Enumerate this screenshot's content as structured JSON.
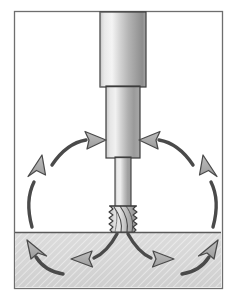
{
  "figure": {
    "title": "Rotary cutting tool in workpiece with chip / coolant flow",
    "caption": "",
    "background_color": "#ffffff",
    "frame": {
      "name": "figure-border",
      "x": 14,
      "y": 11,
      "width": 208,
      "height": 277,
      "stroke_color": "#6e6e6e",
      "stroke_width": 1.4,
      "fill_color": "#ffffff"
    },
    "workpiece": {
      "label": "workpiece",
      "top_y": 232,
      "fill_color": "#d8d8d8",
      "surface_line_color": "#5a5a5a",
      "texture": "fine-diagonal-hatch",
      "texture_color": "#ffffff"
    },
    "tool": {
      "label": "rotary cutting tool",
      "outline_color": "#3b3b3b",
      "metal_light": "#f2f2f2",
      "metal_mid": "#b9b9b9",
      "metal_dark": "#828282",
      "parts": [
        {
          "name": "tool-holder",
          "label": "tool holder",
          "x": 100,
          "y": 11,
          "width": 46,
          "height": 76
        },
        {
          "name": "tool-collar",
          "label": "collar",
          "x": 106,
          "y": 87,
          "width": 34,
          "height": 70
        },
        {
          "name": "tool-shank",
          "label": "shank",
          "x": 115,
          "y": 157,
          "width": 16,
          "height": 48
        },
        {
          "name": "cutter-flutes",
          "label": "fluted cutter",
          "x": 109,
          "y": 205,
          "width": 28,
          "height": 28,
          "flute_count": 4,
          "tooth_count": 9
        }
      ]
    },
    "flow_arrows": {
      "label": "material / coolant flow direction",
      "fill_color": "#a8a8a8",
      "stroke_color": "#4a4a4a",
      "stroke_width": 1.3,
      "items": [
        {
          "name": "arrow-outer-left-up",
          "direction": "up",
          "side": "left",
          "region": "above-surface"
        },
        {
          "name": "arrow-inner-left-in",
          "direction": "right",
          "side": "left",
          "region": "above-surface"
        },
        {
          "name": "arrow-inner-right-in",
          "direction": "left",
          "side": "right",
          "region": "above-surface"
        },
        {
          "name": "arrow-outer-right-up",
          "direction": "up",
          "side": "right",
          "region": "above-surface"
        },
        {
          "name": "arrow-sub-left-out",
          "direction": "left",
          "side": "left",
          "region": "in-workpiece"
        },
        {
          "name": "arrow-sub-right-out",
          "direction": "right",
          "side": "right",
          "region": "in-workpiece"
        },
        {
          "name": "arrow-sub-left-up",
          "direction": "up-left",
          "side": "left",
          "region": "in-workpiece"
        },
        {
          "name": "arrow-sub-right-up",
          "direction": "up-right",
          "side": "right",
          "region": "in-workpiece"
        }
      ]
    }
  }
}
